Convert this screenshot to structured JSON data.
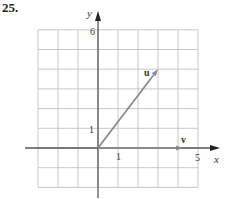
{
  "problem_number": "25.",
  "colors": {
    "grid": "#c8c8c8",
    "axis": "#555555",
    "vector": "#8a8a8a",
    "text": "#333333"
  },
  "chart_data": {
    "type": "vector-plot",
    "title": "",
    "xlabel": "x",
    "ylabel": "y",
    "xlim": [
      -3,
      5
    ],
    "ylim": [
      -2,
      6
    ],
    "grid": true,
    "grid_step": 1,
    "tick_labels": {
      "x": [
        "1",
        "5"
      ],
      "y": [
        "1",
        "6"
      ]
    },
    "vectors": [
      {
        "name": "u",
        "tail": [
          0,
          0
        ],
        "head": [
          3,
          4
        ]
      },
      {
        "name": "v",
        "tail": [
          0,
          0
        ],
        "head": [
          4.25,
          0
        ]
      }
    ]
  }
}
